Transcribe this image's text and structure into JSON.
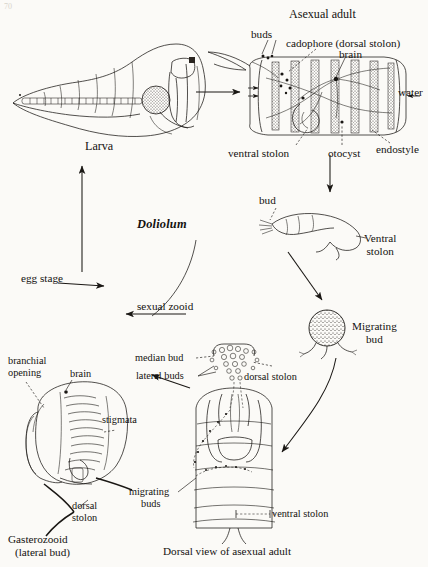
{
  "figure": {
    "genus": "Doliolum",
    "caption_bottom": "Dorsal view of asexual adult",
    "page_mark": "70"
  },
  "stages": {
    "larva": {
      "name": "Larva"
    },
    "asexual_adult": {
      "title": "Asexual adult",
      "labels": {
        "buds": "buds",
        "cadophore": "cadophore (dorsal stolon)",
        "brain": "brain",
        "water": "water",
        "ventral_stolon": "ventral stolon",
        "otocyst": "otocyst",
        "endostyle": "endostyle"
      }
    },
    "ventral_stolon_stage": {
      "bud": "bud",
      "name_line1": "Ventral",
      "name_line2": "stolon"
    },
    "migrating_bud": {
      "name_line1": "Migrating",
      "name_line2": "bud"
    },
    "gasterozooid": {
      "name_line1": "Gasterozooid",
      "name_line2": "(lateral bud)",
      "labels": {
        "branchial_opening_line1": "branchial",
        "branchial_opening_line2": "opening",
        "brain": "brain",
        "stigmata": "stigmata",
        "dorsal_stolon_line1": "dorsal",
        "dorsal_stolon_line2": "stolon"
      }
    },
    "dorsal_view": {
      "labels": {
        "median_bud": "median bud",
        "lateral_buds": "lateral buds",
        "dorsal_stolon": "dorsal stolon",
        "migrating_buds_line1": "migrating",
        "migrating_buds_line2": "buds",
        "ventral_stolon": "ventral stolon"
      }
    }
  },
  "cycle_arrows": {
    "egg_stage": "egg stage",
    "sexual_zooid": "sexual zooid"
  },
  "colors": {
    "ink": "#1a1714",
    "paper": "#fbfaf7"
  }
}
